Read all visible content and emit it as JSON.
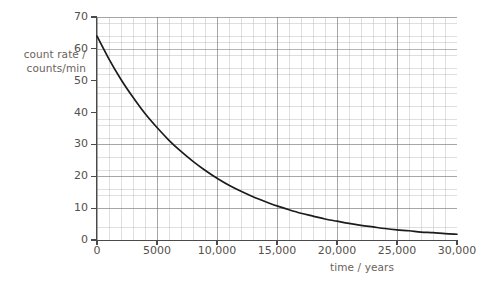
{
  "chart_data": {
    "type": "line",
    "title": "",
    "subtitle": "",
    "xlabel": "time / years",
    "ylabel": "count rate / counts/min",
    "ylabel_lines": [
      "count rate /",
      "counts/min"
    ],
    "xlim": [
      0,
      30000
    ],
    "ylim": [
      0,
      70
    ],
    "grid": true,
    "grid_style": "graph-paper",
    "x_major_step": 5000,
    "x_minor_step": 1000,
    "y_major_step": 10,
    "y_minor_step": 2,
    "legend": "none",
    "x_tick_labels": [
      "0",
      "5000",
      "10,000",
      "15,000",
      "20,000",
      "25,000",
      "30,000"
    ],
    "x_tick_values": [
      0,
      5000,
      10000,
      15000,
      20000,
      25000,
      30000
    ],
    "y_tick_labels": [
      "0",
      "10",
      "20",
      "30",
      "40",
      "50",
      "60",
      "70"
    ],
    "y_tick_values": [
      0,
      10,
      20,
      30,
      40,
      50,
      60,
      70
    ],
    "series": [
      {
        "name": "count rate",
        "x": [
          0,
          1000,
          2000,
          3000,
          4000,
          5000,
          6000,
          7000,
          8000,
          9000,
          10000,
          11000,
          12000,
          13000,
          14000,
          15000,
          16000,
          17000,
          18000,
          19000,
          20000,
          21000,
          22000,
          23000,
          24000,
          25000,
          26000,
          27000,
          28000,
          29000,
          30000
        ],
        "values": [
          64.0,
          56.8,
          50.4,
          44.8,
          39.7,
          35.3,
          31.3,
          27.8,
          24.7,
          21.9,
          19.4,
          17.2,
          15.3,
          13.6,
          12.1,
          10.7,
          9.5,
          8.4,
          7.5,
          6.6,
          5.9,
          5.2,
          4.6,
          4.1,
          3.6,
          3.2,
          2.9,
          2.5,
          2.3,
          2.0,
          1.8
        ],
        "color": "#1c1c1c",
        "style": "solid"
      }
    ],
    "annotations": []
  },
  "axis_titles": {
    "y_line1": "count rate /",
    "y_line2": "counts/min",
    "x": "time / years"
  },
  "colors": {
    "curve": "#1c1c1c",
    "axis": "#4a4a4a",
    "label_text": "#6b6259",
    "tick_text": "#55504b",
    "grid_major": "#787878",
    "grid_minor": "#969696",
    "background": "#ffffff"
  }
}
